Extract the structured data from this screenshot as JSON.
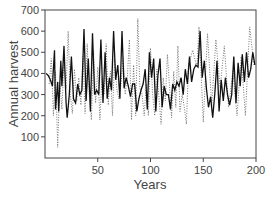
{
  "chart_data": {
    "type": "line",
    "title": "",
    "xlabel": "Years",
    "ylabel": "Annual harvest",
    "xlim": [
      0,
      200
    ],
    "ylim": [
      0,
      700
    ],
    "x_ticks": [
      50,
      100,
      150,
      200
    ],
    "y_ticks": [
      100,
      200,
      300,
      400,
      500,
      600,
      700
    ],
    "grid": false,
    "legend": null,
    "series": [
      {
        "name": "solid",
        "style": "solid",
        "x": [
          1,
          3,
          5,
          7,
          9,
          10,
          12,
          13,
          15,
          16,
          18,
          20,
          21,
          23,
          25,
          27,
          29,
          31,
          33,
          35,
          37,
          39,
          41,
          43,
          45,
          47,
          49,
          51,
          53,
          55,
          57,
          59,
          61,
          63,
          65,
          67,
          69,
          71,
          73,
          75,
          77,
          79,
          81,
          83,
          85,
          87,
          89,
          91,
          93,
          95,
          97,
          99,
          101,
          103,
          105,
          107,
          109,
          111,
          113,
          115,
          117,
          119,
          121,
          123,
          125,
          127,
          129,
          131,
          133,
          135,
          137,
          139,
          141,
          143,
          145,
          147,
          149,
          151,
          153,
          155,
          157,
          159,
          161,
          163,
          165,
          167,
          169,
          171,
          173,
          175,
          177,
          179,
          181,
          183,
          185,
          187,
          189,
          191,
          193,
          195,
          197,
          199
        ],
        "y": [
          400,
          390,
          370,
          340,
          510,
          230,
          360,
          220,
          460,
          340,
          530,
          260,
          190,
          300,
          480,
          280,
          260,
          350,
          300,
          320,
          610,
          270,
          470,
          220,
          590,
          300,
          320,
          300,
          560,
          260,
          500,
          280,
          380,
          320,
          600,
          370,
          440,
          280,
          600,
          330,
          380,
          340,
          290,
          350,
          350,
          220,
          280,
          320,
          350,
          420,
          230,
          500,
          380,
          470,
          220,
          390,
          470,
          240,
          340,
          300,
          300,
          230,
          350,
          320,
          360,
          340,
          380,
          300,
          420,
          350,
          480,
          360,
          420,
          440,
          430,
          600,
          380,
          460,
          330,
          240,
          290,
          190,
          310,
          460,
          220,
          370,
          270,
          380,
          300,
          250,
          300,
          480,
          260,
          450,
          340,
          490,
          360,
          500,
          380,
          420,
          500,
          440
        ]
      },
      {
        "name": "dotted",
        "style": "dotted",
        "x": [
          4,
          6,
          8,
          10,
          12,
          14,
          16,
          18,
          20,
          22,
          24,
          26,
          28,
          30,
          32,
          34,
          36,
          38,
          40,
          42,
          44,
          46,
          48,
          50,
          52,
          54,
          56,
          58,
          60,
          62,
          64,
          66,
          68,
          70,
          72,
          74,
          76,
          78,
          80,
          82,
          84,
          86,
          88,
          90,
          92,
          94,
          96,
          98,
          100,
          102,
          104,
          106,
          108,
          110,
          112,
          114,
          116,
          118,
          120,
          122,
          124,
          126,
          128,
          130,
          132,
          134,
          136,
          140,
          144,
          146,
          150,
          154,
          158,
          162,
          166,
          170,
          174,
          178,
          182,
          186,
          190,
          194,
          198
        ],
        "y": [
          350,
          470,
          200,
          410,
          50,
          360,
          230,
          460,
          330,
          600,
          300,
          210,
          420,
          270,
          380,
          250,
          480,
          210,
          540,
          300,
          180,
          510,
          260,
          430,
          180,
          380,
          300,
          540,
          250,
          410,
          200,
          470,
          330,
          280,
          350,
          470,
          300,
          380,
          560,
          180,
          440,
          200,
          660,
          330,
          300,
          200,
          350,
          200,
          520,
          300,
          200,
          420,
          290,
          160,
          380,
          270,
          490,
          340,
          190,
          410,
          240,
          530,
          220,
          300,
          240,
          160,
          440,
          510,
          430,
          620,
          170,
          590,
          250,
          560,
          330,
          530,
          240,
          410,
          200,
          480,
          200,
          620,
          440
        ]
      }
    ]
  }
}
